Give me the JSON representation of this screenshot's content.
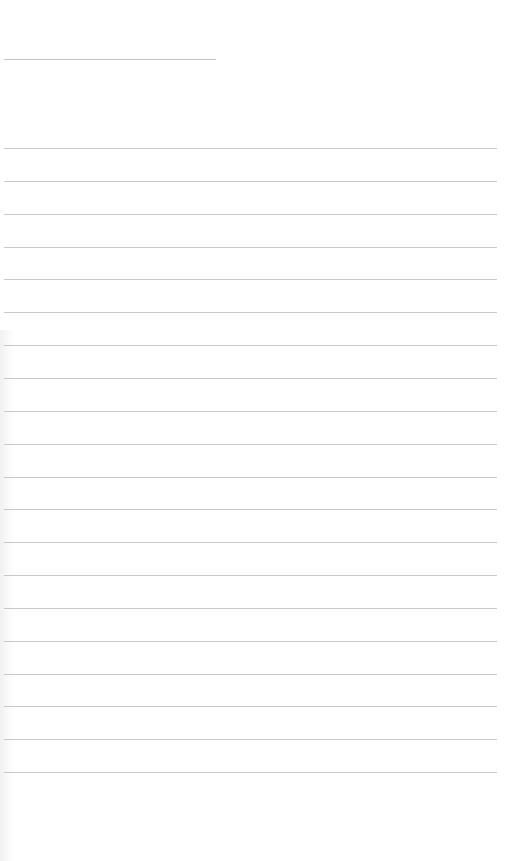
{
  "page": {
    "type": "blank-ruled-paper",
    "background_color": "#ffffff",
    "line_color": "#c8c8c8",
    "title_line": {
      "x1": 4,
      "x2": 216,
      "y": 59
    },
    "ruled_lines": {
      "count": 20,
      "first_y": 148,
      "spacing": 32.85,
      "x1": 4,
      "x2": 497
    },
    "text": []
  }
}
